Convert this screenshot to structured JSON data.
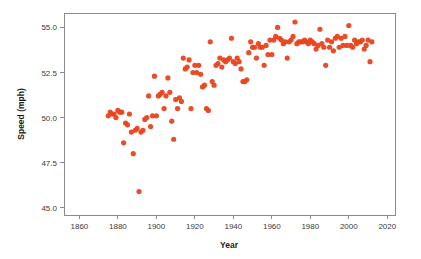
{
  "chart_data": {
    "type": "scatter",
    "title": "",
    "xlabel": "Year",
    "ylabel": "Speed (mph)",
    "xlim": [
      1852,
      2024
    ],
    "ylim": [
      44.6,
      55.8
    ],
    "xticks": [
      1860,
      1880,
      1900,
      1920,
      1940,
      1960,
      1980,
      2000,
      2020
    ],
    "yticks": [
      45.0,
      47.5,
      50.0,
      52.5,
      55.0
    ],
    "ytick_labels": [
      "45.0",
      "47.5",
      "50.0",
      "52.5",
      "55.0"
    ],
    "xtick_labels": [
      "1860",
      "1880",
      "1900",
      "1920",
      "1940",
      "1960",
      "1980",
      "2000",
      "2020"
    ],
    "grid": false,
    "legend": "none",
    "marker": {
      "shape": "circle",
      "color": "#E8431E",
      "radius": 2.6,
      "opacity": 0.95
    },
    "series": [
      {
        "name": "Winning speed",
        "x": [
          1875,
          1876,
          1877,
          1878,
          1879,
          1880,
          1881,
          1882,
          1883,
          1884,
          1885,
          1886,
          1887,
          1888,
          1889,
          1890,
          1891,
          1892,
          1893,
          1894,
          1895,
          1896,
          1897,
          1898,
          1899,
          1900,
          1901,
          1902,
          1903,
          1904,
          1905,
          1906,
          1907,
          1908,
          1909,
          1910,
          1911,
          1912,
          1913,
          1914,
          1915,
          1916,
          1917,
          1918,
          1919,
          1920,
          1921,
          1922,
          1923,
          1924,
          1925,
          1926,
          1927,
          1928,
          1929,
          1930,
          1931,
          1932,
          1933,
          1934,
          1935,
          1936,
          1937,
          1938,
          1939,
          1940,
          1941,
          1942,
          1943,
          1944,
          1945,
          1946,
          1947,
          1948,
          1949,
          1950,
          1951,
          1952,
          1953,
          1954,
          1955,
          1956,
          1957,
          1958,
          1959,
          1960,
          1961,
          1962,
          1963,
          1964,
          1965,
          1966,
          1967,
          1968,
          1969,
          1970,
          1971,
          1972,
          1973,
          1974,
          1975,
          1976,
          1977,
          1978,
          1979,
          1980,
          1981,
          1982,
          1983,
          1984,
          1985,
          1986,
          1987,
          1988,
          1989,
          1990,
          1991,
          1992,
          1993,
          1994,
          1995,
          1996,
          1997,
          1998,
          1999,
          2000,
          2001,
          2002,
          2003,
          2004,
          2005,
          2006,
          2007,
          2008,
          2009,
          2010,
          2011,
          2012
        ],
        "y": [
          50.1,
          50.3,
          50.2,
          50.2,
          50.0,
          50.4,
          50.3,
          50.3,
          48.6,
          49.7,
          49.6,
          50.2,
          49.2,
          48.0,
          49.3,
          49.4,
          45.9,
          49.2,
          49.3,
          49.9,
          50.0,
          51.2,
          49.5,
          50.1,
          52.3,
          50.1,
          51.2,
          51.3,
          51.4,
          50.5,
          51.2,
          52.2,
          51.4,
          49.8,
          48.8,
          51.0,
          50.5,
          51.1,
          50.9,
          53.3,
          52.7,
          52.8,
          53.2,
          50.5,
          52.5,
          52.9,
          52.5,
          52.9,
          52.4,
          51.7,
          51.8,
          50.5,
          50.4,
          54.2,
          52.0,
          51.8,
          52.9,
          53.0,
          53.3,
          52.8,
          53.2,
          53.1,
          53.2,
          53.3,
          54.4,
          53.1,
          53.0,
          53.3,
          53.1,
          52.7,
          52.0,
          52.0,
          52.1,
          53.6,
          54.2,
          53.9,
          53.9,
          53.3,
          54.1,
          53.9,
          53.9,
          52.9,
          54.0,
          53.5,
          54.3,
          53.5,
          54.3,
          54.5,
          55.0,
          54.4,
          54.3,
          54.1,
          54.2,
          53.3,
          54.2,
          54.3,
          54.5,
          55.3,
          54.1,
          54.2,
          54.2,
          54.2,
          54.3,
          54.2,
          54.1,
          54.3,
          54.2,
          54.1,
          53.8,
          54.0,
          54.9,
          54.1,
          53.9,
          52.9,
          54.3,
          53.9,
          54.2,
          53.7,
          54.4,
          54.5,
          53.9,
          54.4,
          54.0,
          54.5,
          54.0,
          55.1,
          54.0,
          53.9,
          54.3,
          54.1,
          54.2,
          54.2,
          54.3,
          53.8,
          54.0,
          54.3,
          53.1,
          54.2
        ]
      }
    ]
  },
  "plot_geometry": {
    "left": 64,
    "right": 395,
    "top": 13,
    "bottom": 215
  },
  "axis": {
    "x_title": "Year",
    "y_title": "Speed (mph)"
  }
}
